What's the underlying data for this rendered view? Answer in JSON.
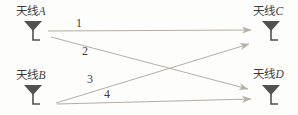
{
  "diagram": {
    "antennas": {
      "a": {
        "name": "天线",
        "letter": "A"
      },
      "b": {
        "name": "天线",
        "letter": "B"
      },
      "c": {
        "name": "天线",
        "letter": "C"
      },
      "d": {
        "name": "天线",
        "letter": "D"
      }
    },
    "paths": {
      "p1": {
        "label": "1",
        "from": "A",
        "to": "C"
      },
      "p2": {
        "label": "2",
        "from": "A",
        "to": "D"
      },
      "p3": {
        "label": "3",
        "from": "B",
        "to": "C"
      },
      "p4": {
        "label": "4",
        "from": "B",
        "to": "D"
      }
    },
    "colors": {
      "background": "#fdfdfb",
      "line": "#b4aea5",
      "label_text": "#3d3d3d",
      "icon": "#515151"
    }
  }
}
